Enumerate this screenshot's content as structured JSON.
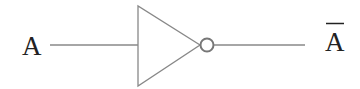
{
  "diagram": {
    "input_label": "A",
    "output_label": "A",
    "output_overbar": true,
    "stroke_color": "#888888",
    "text_color": "#222222"
  }
}
